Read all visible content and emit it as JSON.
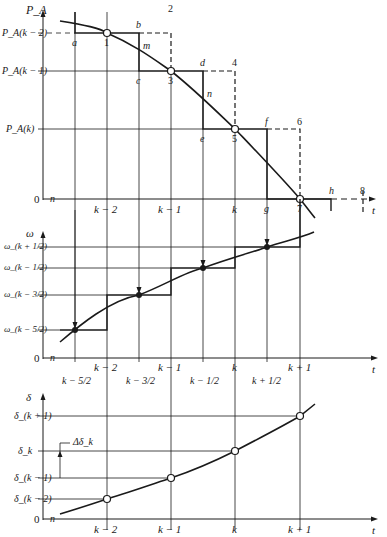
{
  "figure": {
    "colors": {
      "ink": "#1a1a1a",
      "grid": "#333333",
      "background": "#ffffff"
    },
    "top_panel": {
      "y_axis_label": "P_A",
      "x_axis_label": "t",
      "origin_label": "0",
      "origin_marker": "n",
      "y_ticks": [
        "P_A(k − 2)",
        "P_A(k − 1)",
        "P_A(k)"
      ],
      "x_ticks": [
        "k − 2",
        "k − 1",
        "k"
      ],
      "point_numbers": [
        "1",
        "2",
        "3",
        "4",
        "5",
        "6",
        "7",
        "8"
      ],
      "point_letters": [
        "a",
        "b",
        "c",
        "d",
        "e",
        "f",
        "g",
        "h"
      ],
      "curve_intersections": [
        "m",
        "n"
      ]
    },
    "middle_panel": {
      "y_axis_label": "ω",
      "x_axis_label": "t",
      "origin_label": "0",
      "origin_marker": "n",
      "y_ticks": [
        "ω_(k + 1/2)",
        "ω_(k − 1/2)",
        "ω_(k − 3/2)",
        "ω_(k − 5/2)"
      ],
      "x_ticks": [
        "k − 2",
        "k − 1",
        "k",
        "k + 1"
      ],
      "x_half_ticks": [
        "k − 5/2",
        "k − 3/2",
        "k − 1/2",
        "k + 1/2"
      ]
    },
    "bottom_panel": {
      "y_axis_label": "δ",
      "x_axis_label": "t",
      "origin_label": "0",
      "origin_marker": "n",
      "y_ticks": [
        "δ_(k + 1)",
        "δ_k",
        "δ_(k − 1)",
        "δ_(k − 2)"
      ],
      "x_ticks": [
        "k − 2",
        "k − 1",
        "k",
        "k + 1"
      ],
      "annotation": "Δδ_k"
    }
  }
}
